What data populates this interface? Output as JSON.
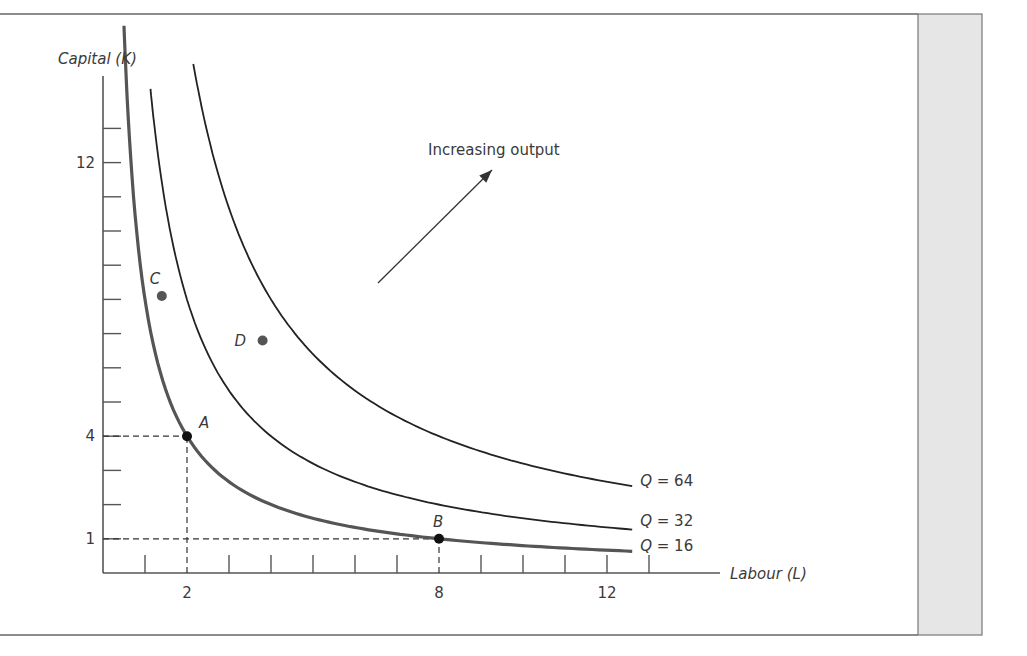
{
  "colors": {
    "axis": "#555555",
    "curve": "#222222",
    "curve_q16": "#555555",
    "dashed": "#333333",
    "point_dark": "#111111",
    "point_gray": "#555555",
    "side_panel": "#e6e6e6",
    "side_panel_border": "#777777",
    "frame_line": "#666666"
  },
  "chart_data": {
    "type": "line",
    "title": "",
    "xlabel": "Labour (L)",
    "ylabel": "Capital (K)",
    "xlim": [
      0,
      13.5
    ],
    "ylim": [
      0,
      14
    ],
    "x_ticks": [
      1,
      2,
      3,
      4,
      5,
      6,
      7,
      8,
      9,
      10,
      11,
      12,
      13
    ],
    "x_tick_labels": {
      "2": "2",
      "8": "8",
      "12": "12"
    },
    "y_ticks": [
      1,
      2,
      3,
      4,
      5,
      6,
      7,
      8,
      9,
      10,
      11,
      12,
      13
    ],
    "y_tick_labels": {
      "1": "1",
      "4": "4",
      "12": "12"
    },
    "grid": false,
    "series": [
      {
        "name": "Q = 16",
        "label": "Q = 16",
        "product_LK": 8,
        "L_start": 0.5,
        "L_end": 12.6,
        "emphasis": true
      },
      {
        "name": "Q = 32",
        "label": "Q = 32",
        "product_LK": 16,
        "L_start": 1.13,
        "L_end": 12.6,
        "emphasis": false
      },
      {
        "name": "Q = 64",
        "label": "Q = 64",
        "product_LK": 32,
        "L_start": 2.15,
        "L_end": 12.6,
        "emphasis": false
      }
    ],
    "points": [
      {
        "label": "A",
        "L": 2,
        "K": 4,
        "color": "dark",
        "on_curve": "Q = 16"
      },
      {
        "label": "B",
        "L": 8,
        "K": 1,
        "color": "dark",
        "on_curve": "Q = 16"
      },
      {
        "label": "C",
        "L": 1.4,
        "K": 8.1,
        "color": "gray"
      },
      {
        "label": "D",
        "L": 3.8,
        "K": 6.8,
        "color": "gray"
      }
    ],
    "reference_lines": [
      {
        "from": [
          0,
          4
        ],
        "to": [
          2,
          4
        ]
      },
      {
        "from": [
          2,
          0
        ],
        "to": [
          2,
          4
        ]
      },
      {
        "from": [
          0,
          1
        ],
        "to": [
          8,
          1
        ]
      },
      {
        "from": [
          8,
          0
        ],
        "to": [
          8,
          1
        ]
      }
    ],
    "annotations": [
      {
        "text": "Increasing output",
        "arrow_from": [
          6.5,
          8.5
        ],
        "arrow_to": [
          9.2,
          11.8
        ]
      }
    ]
  }
}
